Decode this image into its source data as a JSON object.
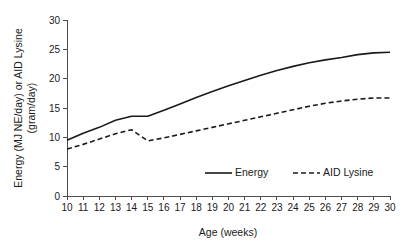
{
  "chart_data": {
    "type": "line",
    "title": "",
    "xlabel": "Age (weeks)",
    "ylabel": "Energy (MJ NE/day) or AID Lysine (gram/day)",
    "ylabel_line1": "Energy (MJ NE/day) or AID Lysine",
    "ylabel_line2": "(gram/day)",
    "xlim": [
      10,
      30
    ],
    "ylim": [
      0,
      30
    ],
    "grid": false,
    "legend_position": "inside-bottom-center",
    "x": [
      10,
      11,
      12,
      13,
      14,
      15,
      16,
      17,
      18,
      19,
      20,
      21,
      22,
      23,
      24,
      25,
      26,
      27,
      28,
      29,
      30
    ],
    "xticks": [
      10,
      11,
      12,
      13,
      14,
      15,
      16,
      17,
      18,
      19,
      20,
      21,
      22,
      23,
      24,
      25,
      26,
      27,
      28,
      29,
      30
    ],
    "yticks": [
      0,
      5,
      10,
      15,
      20,
      25,
      30
    ],
    "series": [
      {
        "name": "Energy",
        "style": "solid",
        "unit": "MJ NE/day",
        "values": [
          9.5,
          10.7,
          11.7,
          12.9,
          13.6,
          13.6,
          14.6,
          15.7,
          16.8,
          17.8,
          18.8,
          19.7,
          20.6,
          21.4,
          22.1,
          22.7,
          23.2,
          23.6,
          24.1,
          24.4,
          24.5
        ]
      },
      {
        "name": "AID Lysine",
        "style": "dashed",
        "unit": "gram/day",
        "values": [
          8.0,
          8.8,
          9.7,
          10.6,
          11.3,
          9.4,
          9.9,
          10.5,
          11.1,
          11.7,
          12.3,
          12.9,
          13.5,
          14.1,
          14.7,
          15.3,
          15.8,
          16.2,
          16.5,
          16.7,
          16.7
        ]
      }
    ],
    "annotations": [
      {
        "label": "AID Lysine peak before week 15 drop",
        "x": 13.7,
        "y": 11.4
      },
      {
        "label": "Energy plateau",
        "x": 14.5,
        "y": 13.6
      }
    ]
  },
  "legend": {
    "items": [
      {
        "label": "Energy",
        "style": "solid"
      },
      {
        "label": "AID Lysine",
        "style": "dashed"
      }
    ]
  }
}
